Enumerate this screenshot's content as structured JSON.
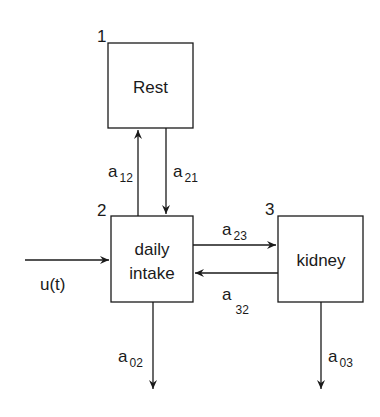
{
  "diagram": {
    "type": "compartment-model",
    "compartments": [
      {
        "id": "1",
        "number": "1",
        "label": "Rest",
        "label_lines": [
          "Rest"
        ]
      },
      {
        "id": "2",
        "number": "2",
        "label": "daily intake",
        "label_lines": [
          "daily",
          "intake"
        ]
      },
      {
        "id": "3",
        "number": "3",
        "label": "kidney",
        "label_lines": [
          "kidney"
        ]
      }
    ],
    "flows": [
      {
        "id": "a12",
        "from": "2",
        "to": "1",
        "label_base": "a",
        "label_sub": "12"
      },
      {
        "id": "a21",
        "from": "1",
        "to": "2",
        "label_base": "a",
        "label_sub": "21"
      },
      {
        "id": "a23",
        "from": "2",
        "to": "3",
        "label_base": "a",
        "label_sub": "23"
      },
      {
        "id": "a32",
        "from": "3",
        "to": "2",
        "label_base": "a",
        "label_sub": "32"
      },
      {
        "id": "a02",
        "from": "2",
        "to": "out",
        "label_base": "a",
        "label_sub": "02"
      },
      {
        "id": "a03",
        "from": "3",
        "to": "out",
        "label_base": "a",
        "label_sub": "03"
      }
    ],
    "input": {
      "to": "2",
      "label": "u(t)"
    },
    "colors": {
      "stroke": "#1a1a1a",
      "background": "#ffffff"
    }
  }
}
